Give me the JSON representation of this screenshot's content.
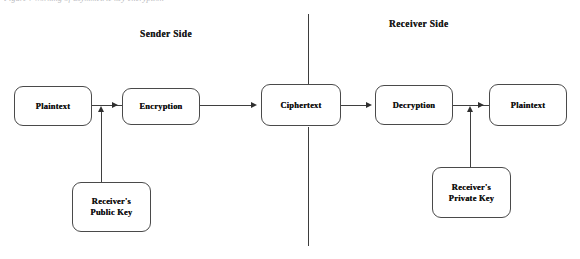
{
  "page": {
    "top_caption": "Figure : Working of asymmetric key encryption",
    "background_color": "#ffffff",
    "stroke_color": "#3f3f3f",
    "text_color": "#141414"
  },
  "sections": {
    "sender": {
      "label": "Sender Side"
    },
    "receiver": {
      "label": "Receiver Side"
    },
    "divider": {
      "name": "sender-receiver-divider"
    }
  },
  "nodes": {
    "plaintext_in": {
      "label": "Plaintext"
    },
    "encryption": {
      "label": "Encryption"
    },
    "ciphertext": {
      "label": "Ciphertext"
    },
    "decryption": {
      "label": "Decryption"
    },
    "plaintext_out": {
      "label": "Plaintext"
    },
    "public_key": {
      "label": "Receiver's\nPublic Key"
    },
    "private_key": {
      "label": "Receiver's\nPrivate Key"
    }
  },
  "connectors": [
    {
      "name": "plaintext-to-encryption",
      "from": "plaintext_in",
      "to": "encryption",
      "arrow": "right"
    },
    {
      "name": "encryption-to-ciphertext",
      "from": "encryption",
      "to": "ciphertext",
      "arrow": "right"
    },
    {
      "name": "ciphertext-to-decryption",
      "from": "ciphertext",
      "to": "decryption",
      "arrow": "right"
    },
    {
      "name": "decryption-to-plaintext",
      "from": "decryption",
      "to": "plaintext_out",
      "arrow": "right"
    },
    {
      "name": "public-key-to-encryption",
      "from": "public_key",
      "to": "encryption",
      "arrow": "up"
    },
    {
      "name": "private-key-to-decryption",
      "from": "private_key",
      "to": "plaintext_out",
      "arrow": "up"
    }
  ]
}
